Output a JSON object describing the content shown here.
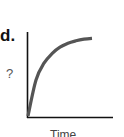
{
  "figure": {
    "panel_label": "d.",
    "y_axis_label": "?",
    "x_axis_label": "Time"
  },
  "colors": {
    "axis": "#111111",
    "curve": "#555555",
    "background": "#ffffff"
  },
  "chart_data": {
    "type": "line",
    "title": "",
    "panel": "d.",
    "xlabel": "Time",
    "ylabel": "?",
    "grid": false,
    "legend": null,
    "ticks": {
      "x": [],
      "y": []
    },
    "series": [
      {
        "name": "curve",
        "x": [
          0,
          0.1,
          0.2,
          0.3,
          0.4,
          0.5,
          0.6,
          0.7,
          0.8
        ],
        "values": [
          0,
          0.45,
          0.66,
          0.78,
          0.86,
          0.91,
          0.94,
          0.96,
          0.97
        ]
      }
    ],
    "xlim": [
      0,
      1
    ],
    "ylim": [
      0,
      1
    ]
  }
}
